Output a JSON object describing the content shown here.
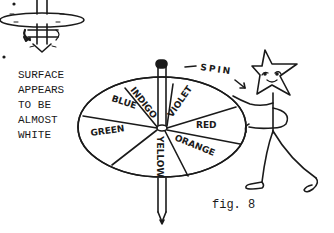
{
  "figure": {
    "label": "fig. 8",
    "note_lines": [
      "SURFACE",
      "APPEARS",
      "TO BE",
      "ALMOST",
      "WHITE"
    ],
    "action_label": "SPIN",
    "disc_segments": [
      {
        "name": "INDIGO",
        "color": "#1a1a1a"
      },
      {
        "name": "VIOLET",
        "color": "#1a1a1a"
      },
      {
        "name": "RED",
        "color": "#1a1a1a"
      },
      {
        "name": "ORANGE",
        "color": "#1a1a1a"
      },
      {
        "name": "YELLOW",
        "color": "#1a1a1a"
      },
      {
        "name": "GREEN",
        "color": "#1a1a1a"
      },
      {
        "name": "BLUE",
        "color": "#1a1a1a"
      }
    ],
    "ink_color": "#1a1a1a",
    "paper_color": "#ffffff"
  }
}
